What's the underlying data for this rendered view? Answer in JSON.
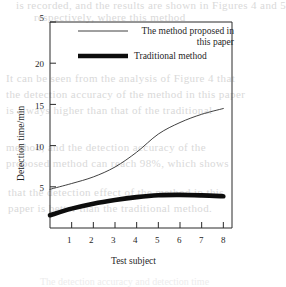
{
  "figure": {
    "caption": "The detection accuracy and detection time",
    "ghost_lines": [
      "is recorded, and the results are shown in Figures 4 and 5",
      "respectively, where this method",
      "It can be seen from the analysis of Figure 4 that",
      "the detection accuracy of the method in this paper",
      "is always higher than that of the traditional",
      "method, and the detection accuracy of the",
      "proposed method can reach 98%, which shows",
      "that the detection effect of the method in this",
      "paper is better than the traditional method."
    ]
  },
  "chart_data": {
    "type": "line",
    "title": "",
    "xlabel": "Test subject",
    "ylabel": "Detection time/min",
    "xlim": [
      0,
      8.4
    ],
    "ylim": [
      0,
      25
    ],
    "xticks": [
      1,
      2,
      3,
      4,
      5,
      6,
      7,
      8
    ],
    "xtick_labels": [
      "1",
      "2",
      "3",
      "4",
      "5",
      "6",
      "7",
      "8"
    ],
    "yticks": [
      5,
      10,
      15,
      20,
      25
    ],
    "ytick_labels": [
      "5",
      "10",
      "15",
      "20",
      "5"
    ],
    "grid": false,
    "legend_position": "top-right",
    "x": [
      0,
      1,
      2,
      3,
      4,
      5,
      6,
      7,
      8
    ],
    "series": [
      {
        "name": "The method proposed in this paper",
        "style": "thin",
        "color": "#2b2b2b",
        "line_width": 0.9,
        "values": [
          4.7,
          5.4,
          6.2,
          7.4,
          9.2,
          11.4,
          12.8,
          13.8,
          14.5
        ]
      },
      {
        "name": "Traditional method",
        "style": "thick",
        "color": "#0d0d0d",
        "line_width": 4.6,
        "values": [
          1.55,
          2.35,
          2.95,
          3.4,
          3.75,
          3.98,
          4.02,
          3.96,
          3.85
        ]
      }
    ]
  },
  "legend": {
    "entries": [
      {
        "label": "The method proposed in this paper",
        "style": "thin"
      },
      {
        "label": "Traditional method",
        "style": "thick"
      }
    ]
  }
}
